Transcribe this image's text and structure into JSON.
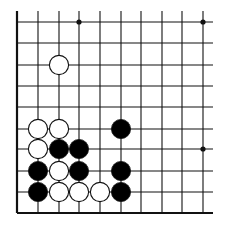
{
  "board": {
    "description": "Go board corner diagram (lower-left corner region)",
    "colors": {
      "background": "#ffffff",
      "line": "#111111",
      "black_stone": "#000000",
      "white_stone": "#ffffff",
      "stone_outline": "#111111"
    },
    "columns_x": [
      17,
      38,
      59,
      79,
      100,
      121,
      141,
      162,
      182,
      203
    ],
    "rows_y": [
      22,
      43,
      65,
      86,
      107,
      129,
      149,
      171,
      192,
      213
    ],
    "left_edge": true,
    "bottom_edge": true,
    "line_extent": {
      "top": 11,
      "right": 213
    },
    "star_points": [
      {
        "col": 3,
        "row": 0
      },
      {
        "col": 9,
        "row": 0
      },
      {
        "col": 9,
        "row": 6
      }
    ],
    "stones": [
      {
        "color": "white",
        "col": 2,
        "row": 2
      },
      {
        "color": "white",
        "col": 1,
        "row": 5
      },
      {
        "color": "white",
        "col": 2,
        "row": 5
      },
      {
        "color": "black",
        "col": 5,
        "row": 5
      },
      {
        "color": "white",
        "col": 1,
        "row": 6
      },
      {
        "color": "black",
        "col": 2,
        "row": 6
      },
      {
        "color": "black",
        "col": 3,
        "row": 6
      },
      {
        "color": "black",
        "col": 1,
        "row": 7
      },
      {
        "color": "white",
        "col": 2,
        "row": 7
      },
      {
        "color": "black",
        "col": 3,
        "row": 7
      },
      {
        "color": "black",
        "col": 5,
        "row": 7
      },
      {
        "color": "black",
        "col": 1,
        "row": 8
      },
      {
        "color": "white",
        "col": 2,
        "row": 8
      },
      {
        "color": "white",
        "col": 3,
        "row": 8
      },
      {
        "color": "white",
        "col": 4,
        "row": 8
      },
      {
        "color": "black",
        "col": 5,
        "row": 8
      }
    ]
  }
}
